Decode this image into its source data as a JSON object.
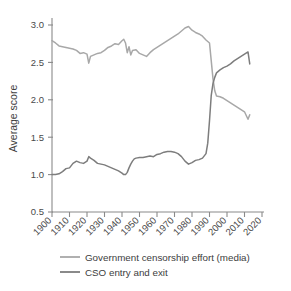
{
  "chart_data": {
    "type": "line",
    "title": "",
    "xlabel": "",
    "ylabel": "Average score",
    "xlim": [
      1900,
      2020
    ],
    "ylim": [
      0.5,
      3.0
    ],
    "grid": false,
    "legend_position": "bottom",
    "xticks": [
      "1900",
      "1910",
      "1920",
      "1930",
      "1940",
      "1950",
      "1960",
      "1970",
      "1980",
      "1990",
      "2000",
      "2010",
      "2020"
    ],
    "yticks": [
      "0.5",
      "1.0",
      "1.5",
      "2.0",
      "2.5",
      "3.0"
    ],
    "colors": {
      "censorship": "#a8a8a8",
      "cso": "#7d7d7d"
    },
    "series": [
      {
        "name": "Government censorship effort (media)",
        "color": "#a8a8a8",
        "x": [
          1900,
          1902,
          1904,
          1906,
          1908,
          1910,
          1912,
          1914,
          1916,
          1918,
          1920,
          1921,
          1922,
          1924,
          1926,
          1928,
          1930,
          1932,
          1934,
          1936,
          1938,
          1940,
          1941,
          1942,
          1943,
          1944,
          1945,
          1946,
          1948,
          1950,
          1952,
          1954,
          1956,
          1958,
          1960,
          1962,
          1964,
          1966,
          1968,
          1970,
          1972,
          1974,
          1976,
          1978,
          1980,
          1982,
          1984,
          1986,
          1988,
          1990,
          1991,
          1992,
          1993,
          1994,
          1996,
          1998,
          2000,
          2002,
          2004,
          2006,
          2008,
          2010,
          2012,
          2013
        ],
        "y": [
          2.79,
          2.76,
          2.72,
          2.71,
          2.7,
          2.69,
          2.68,
          2.66,
          2.62,
          2.63,
          2.61,
          2.49,
          2.58,
          2.6,
          2.62,
          2.63,
          2.66,
          2.7,
          2.72,
          2.75,
          2.74,
          2.79,
          2.81,
          2.76,
          2.63,
          2.71,
          2.6,
          2.66,
          2.67,
          2.62,
          2.6,
          2.58,
          2.63,
          2.67,
          2.7,
          2.73,
          2.76,
          2.79,
          2.82,
          2.85,
          2.88,
          2.92,
          2.96,
          2.98,
          2.93,
          2.9,
          2.88,
          2.85,
          2.8,
          2.76,
          2.52,
          2.28,
          2.12,
          2.05,
          2.04,
          2.02,
          1.99,
          1.96,
          1.93,
          1.9,
          1.87,
          1.84,
          1.74,
          1.8
        ]
      },
      {
        "name": "CSO entry and exit",
        "color": "#7d7d7d",
        "x": [
          1900,
          1902,
          1904,
          1906,
          1908,
          1910,
          1912,
          1914,
          1916,
          1918,
          1920,
          1921,
          1922,
          1924,
          1926,
          1928,
          1930,
          1932,
          1934,
          1936,
          1938,
          1940,
          1941,
          1942,
          1943,
          1944,
          1945,
          1946,
          1947,
          1948,
          1950,
          1952,
          1954,
          1956,
          1958,
          1960,
          1962,
          1964,
          1966,
          1968,
          1970,
          1972,
          1974,
          1976,
          1978,
          1980,
          1982,
          1984,
          1986,
          1988,
          1989,
          1990,
          1991,
          1992,
          1993,
          1994,
          1996,
          1998,
          2000,
          2002,
          2004,
          2006,
          2008,
          2010,
          2012,
          2013
        ],
        "y": [
          1.0,
          1.0,
          1.01,
          1.04,
          1.08,
          1.09,
          1.15,
          1.18,
          1.16,
          1.15,
          1.18,
          1.24,
          1.22,
          1.19,
          1.15,
          1.14,
          1.13,
          1.11,
          1.09,
          1.07,
          1.05,
          1.02,
          1.0,
          1.0,
          1.03,
          1.09,
          1.14,
          1.18,
          1.21,
          1.22,
          1.23,
          1.23,
          1.24,
          1.25,
          1.24,
          1.27,
          1.28,
          1.3,
          1.31,
          1.31,
          1.3,
          1.28,
          1.24,
          1.18,
          1.14,
          1.16,
          1.19,
          1.2,
          1.22,
          1.28,
          1.42,
          1.72,
          2.06,
          2.22,
          2.3,
          2.36,
          2.4,
          2.43,
          2.45,
          2.48,
          2.52,
          2.55,
          2.58,
          2.61,
          2.64,
          2.48
        ]
      }
    ]
  },
  "axis": {
    "ylabel": "Average score"
  },
  "legend": {
    "items": [
      {
        "label": "Government censorship effort (media)",
        "color": "#a8a8a8"
      },
      {
        "label": "CSO entry and exit",
        "color": "#7d7d7d"
      }
    ]
  }
}
